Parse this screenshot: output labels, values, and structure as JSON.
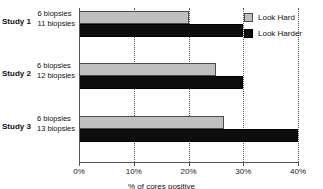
{
  "chart_data": {
    "type": "bar",
    "orientation": "horizontal",
    "title": "",
    "xlabel": "% of cores positive",
    "ylabel": "",
    "categories": [
      "Study 1",
      "Study 2",
      "Study 3"
    ],
    "category_notes": [
      [
        "6 biopsies",
        "11 biopsies"
      ],
      [
        "6 biopsies",
        "12 biopsies"
      ],
      [
        "6 biopsies",
        "13 biopsies"
      ]
    ],
    "series": [
      {
        "name": "Look Hard",
        "color": "#bfbfbf",
        "values": [
          20,
          25,
          26.5
        ]
      },
      {
        "name": "Look Harder",
        "color": "#0d0d0d",
        "values": [
          30,
          30,
          40
        ]
      }
    ],
    "xlim": [
      0,
      40
    ],
    "xticks": [
      0,
      10,
      20,
      30,
      40
    ],
    "xticklabels": [
      "0%",
      "10%",
      "20%",
      "30%",
      "40%"
    ],
    "grid": "vertical-dotted",
    "legend_position": "top-right-inside"
  },
  "legend": {
    "items": [
      {
        "label": "Look Hard"
      },
      {
        "label": "Look Harder"
      }
    ]
  },
  "axis": {
    "ticklabels": [
      "0%",
      "10%",
      "20%",
      "30%",
      "40%"
    ]
  },
  "caption": "% of cores positive"
}
